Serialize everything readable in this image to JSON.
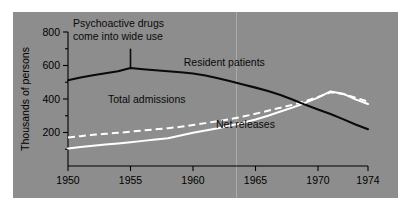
{
  "figure": {
    "panel_color": "#8d8d8d",
    "page_color": "#ffffff"
  },
  "chart_data": {
    "type": "line",
    "title": "",
    "subtitle": "",
    "xlabel": "",
    "ylabel": "Thousands of persons",
    "xlim": [
      1950,
      1974
    ],
    "ylim": [
      0,
      800
    ],
    "grid": false,
    "legend_position": "inline-labels",
    "xticks": [
      1950,
      1955,
      1960,
      1965,
      1970,
      1974
    ],
    "xtick_labels": [
      "1950",
      "1955",
      "1960",
      "1965",
      "1970",
      "1974"
    ],
    "yticks": [
      200,
      400,
      600,
      800
    ],
    "ytick_labels": [
      "200",
      "400",
      "600",
      "800"
    ],
    "yticks_minor": [
      100,
      300,
      500,
      700
    ],
    "x": [
      1950,
      1951,
      1952,
      1953,
      1954,
      1955,
      1956,
      1957,
      1958,
      1959,
      1960,
      1961,
      1962,
      1963,
      1964,
      1965,
      1966,
      1967,
      1968,
      1969,
      1970,
      1971,
      1972,
      1973,
      1974
    ],
    "series": [
      {
        "name": "Resident patients",
        "style": "solid",
        "color": "#0a0a0a",
        "label_x": 1962.5,
        "label_y": 600,
        "values": [
          512,
          528,
          542,
          554,
          566,
          585,
          578,
          572,
          566,
          560,
          552,
          540,
          524,
          506,
          487,
          468,
          448,
          424,
          395,
          365,
          338,
          310,
          280,
          248,
          220
        ]
      },
      {
        "name": "Total admissions",
        "style": "dashed",
        "color": "#ffffff",
        "label_x": 1956.3,
        "label_y": 378,
        "values": [
          170,
          178,
          186,
          192,
          198,
          205,
          212,
          219,
          226,
          234,
          245,
          256,
          268,
          280,
          295,
          312,
          330,
          348,
          366,
          388,
          412,
          440,
          430,
          408,
          385
        ]
      },
      {
        "name": "Net releases",
        "style": "solid",
        "color": "#ffffff",
        "label_x": 1964.2,
        "label_y": 228,
        "values": [
          105,
          113,
          121,
          128,
          135,
          142,
          150,
          158,
          166,
          182,
          198,
          212,
          226,
          242,
          258,
          278,
          300,
          325,
          350,
          378,
          408,
          445,
          432,
          398,
          370
        ]
      }
    ],
    "annotations": [
      {
        "id": "psychoactive-drugs-note",
        "lines": [
          "Psychoactive drugs",
          "come into wide use"
        ],
        "pointer_x": 1955,
        "pointer_y_top": 700,
        "pointer_y_bottom": 585
      }
    ]
  }
}
